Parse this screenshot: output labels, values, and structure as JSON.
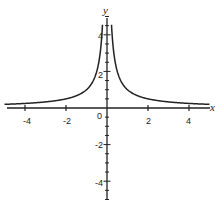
{
  "chart_data": {
    "type": "line",
    "title": "",
    "function": "y = 1/|x|",
    "xlabel": "x",
    "ylabel": "y",
    "xlim": [
      -5,
      5
    ],
    "ylim": [
      -5,
      5
    ],
    "grid": false,
    "legend": null,
    "x_ticks": [
      -4,
      -2,
      0,
      2,
      4
    ],
    "x_tick_labels": [
      "-4",
      "-2",
      "0",
      "2",
      "4"
    ],
    "y_ticks": [
      -4,
      -2,
      2,
      4
    ],
    "y_tick_labels": [
      "-4",
      "-2",
      "2",
      "4"
    ],
    "series": [
      {
        "name": "y = 1/|x|",
        "x": [
          -5,
          -4,
          -3,
          -2,
          -1,
          -0.5,
          -0.25,
          0.25,
          0.5,
          1,
          2,
          3,
          4,
          5
        ],
        "y": [
          0.2,
          0.25,
          0.33,
          0.5,
          1,
          2,
          4,
          4,
          2,
          1,
          0.5,
          0.33,
          0.25,
          0.2
        ]
      }
    ]
  },
  "labels": {
    "x_axis": "x",
    "y_axis": "y",
    "origin": "0",
    "xt": [
      "-4",
      "-2",
      "2",
      "4"
    ],
    "yt": [
      "4",
      "2",
      "-2",
      "-4"
    ]
  }
}
